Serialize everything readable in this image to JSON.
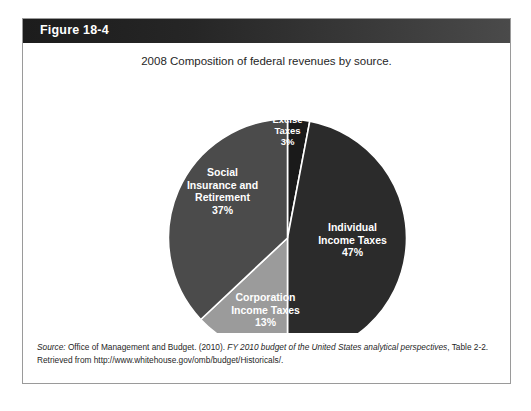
{
  "figure": {
    "label": "Figure 18-4",
    "title": "2008 Composition of federal revenues by source."
  },
  "source": {
    "lead": "Source:",
    "publisher": " Office of Management and Budget. (2010). ",
    "work": "FY 2010 budget of the United States analytical perspectives",
    "tail": ", Table 2-2. Retrieved from http://www.whitehouse.gov/omb/budget/Historicals/."
  },
  "chart_data": {
    "type": "pie",
    "title": "2008 Composition of federal revenues by source.",
    "xlabel": "",
    "ylabel": "",
    "units": "percent",
    "start_angle_deg": 0,
    "direction": "clockwise",
    "legend_position": "none",
    "grid": false,
    "categories": [
      "Excise Taxes",
      "Individual Income Taxes",
      "Corporation Income Taxes",
      "Social Insurance and Retirement"
    ],
    "values": [
      3,
      47,
      13,
      37
    ],
    "slices": [
      {
        "label_lines": [
          "Excise",
          "Taxes"
        ],
        "value": 3,
        "value_label": "3%",
        "color": "#1a1a1a",
        "label_x": 265,
        "label_y": 40,
        "label_font": "small"
      },
      {
        "label_lines": [
          "Individual",
          "Income Taxes"
        ],
        "value": 47,
        "value_label": "47%",
        "color": "#2b2b2b",
        "label_x": 330,
        "label_y": 148,
        "label_font": "normal"
      },
      {
        "label_lines": [
          "Corporation",
          "Income Taxes"
        ],
        "value": 13,
        "value_label": "13%",
        "color": "#9b9b9b",
        "label_x": 243,
        "label_y": 218,
        "label_font": "normal"
      },
      {
        "label_lines": [
          "Social",
          "Insurance and",
          "Retirement"
        ],
        "value": 37,
        "value_label": "37%",
        "color": "#4b4b4b",
        "label_x": 200,
        "label_y": 93,
        "label_font": "normal"
      }
    ],
    "geometry": {
      "cx": 265,
      "cy": 155,
      "r": 119
    }
  }
}
